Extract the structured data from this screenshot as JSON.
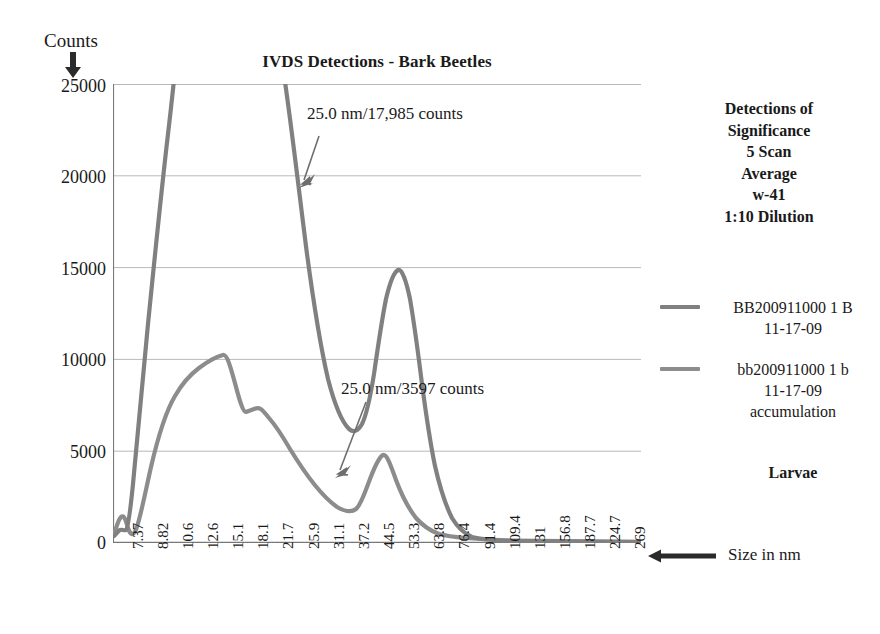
{
  "chart_data": {
    "type": "line",
    "title": "IVDS Detections - Bark Beetles",
    "xlabel": "Size in nm",
    "ylabel": "Counts",
    "ylim": [
      0,
      25000
    ],
    "yticks": [
      "0",
      "5000",
      "10000",
      "15000",
      "20000",
      "25000"
    ],
    "ytick_values": [
      0,
      5000,
      10000,
      15000,
      20000,
      25000
    ],
    "grid": true,
    "legend_position": "right",
    "categories": [
      "7.37",
      "8.82",
      "10.6",
      "12.6",
      "15.1",
      "18.1",
      "21.7",
      "25.9",
      "31.1",
      "37.2",
      "44.5",
      "53.3",
      "63.8",
      "76.4",
      "91.4",
      "109.4",
      "131",
      "156.8",
      "187.7",
      "224.7",
      "269"
    ],
    "series": [
      {
        "name": "BB200911000 1 B 11-17-09",
        "color": "#808080",
        "values": [
          700,
          28000,
          72000,
          66000,
          41000,
          19000,
          7400,
          17985,
          5200,
          1600,
          600,
          250,
          140,
          90,
          60,
          45,
          35,
          25,
          20,
          15,
          10
        ]
      },
      {
        "name": "bb200911000 1 b 11-17-09 accumulation",
        "color": "#8c8c8c",
        "values": [
          420,
          1400,
          5900,
          7100,
          6900,
          5400,
          1550,
          3597,
          1250,
          520,
          230,
          140,
          95,
          70,
          55,
          45,
          35,
          28,
          22,
          16,
          10
        ]
      }
    ],
    "annotations": [
      {
        "text": "25.0 nm/17,985 counts",
        "x": "25.9",
        "y": 17985
      },
      {
        "text": "25.0 nm/3597 counts",
        "x": "25.9",
        "y": 3597
      }
    ]
  },
  "side_panel": {
    "title_lines": [
      "Detections of",
      "Significance",
      "5 Scan",
      "Average",
      "w-41",
      "1:10 Dilution"
    ],
    "legend": [
      {
        "color": "#808080",
        "lines": [
          "BB200911000 1 B",
          "11-17-09"
        ]
      },
      {
        "color": "#8c8c8c",
        "lines": [
          "bb200911000 1 b",
          "11-17-09",
          "accumulation"
        ]
      }
    ],
    "footer_label": "Larvae"
  },
  "axes": {
    "y_title": "Counts",
    "x_title": "Size in nm",
    "y_arrow_icon": "arrow-down-icon",
    "x_arrow_icon": "arrow-left-icon"
  }
}
